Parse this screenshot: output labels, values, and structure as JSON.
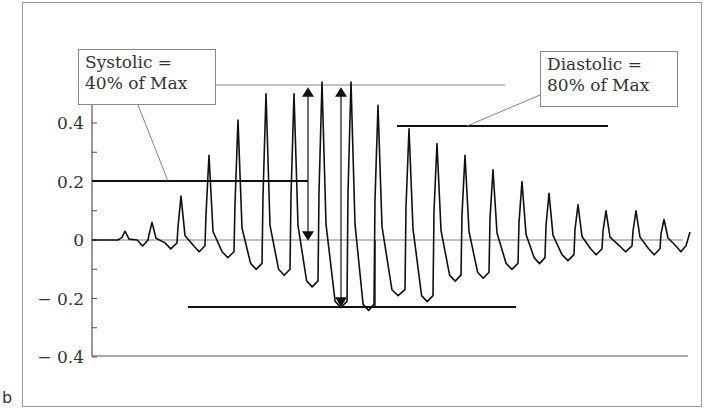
{
  "panel_label": "b",
  "callouts": {
    "systolic": {
      "line1": "Systolic =",
      "line2": "40% of Max"
    },
    "diastolic": {
      "line1": "Diastolic =",
      "line2": "80% of Max"
    }
  },
  "axis": {
    "y_ticks": [
      {
        "value": 0.4,
        "label": "0.4"
      },
      {
        "value": 0.2,
        "label": "0.2"
      },
      {
        "value": 0,
        "label": "0"
      },
      {
        "value": -0.2,
        "label": "− 0.2"
      },
      {
        "value": -0.4,
        "label": "− 0.4"
      }
    ]
  },
  "colors": {
    "trace": "#111111",
    "axis": "#555555",
    "frame": "#9a9a9a",
    "text": "#333333"
  },
  "chart_data": {
    "type": "line",
    "title": "",
    "xlabel": "",
    "ylabel": "",
    "ylim": [
      -0.4,
      0.4
    ],
    "grid": false,
    "legend": null,
    "series": [
      {
        "name": "oscillation amplitude",
        "peaks": [
          0.03,
          0.06,
          0.15,
          0.29,
          0.41,
          0.5,
          0.5,
          0.54,
          0.54,
          0.46,
          0.38,
          0.33,
          0.29,
          0.24,
          0.2,
          0.16,
          0.12,
          0.1,
          0.1,
          0.07
        ],
        "troughs": [
          0,
          -0.01,
          -0.02,
          -0.04,
          -0.08,
          -0.1,
          -0.14,
          -0.21,
          -0.22,
          -0.17,
          -0.19,
          -0.12,
          -0.11,
          -0.08,
          -0.06,
          -0.05,
          -0.03,
          -0.02,
          -0.03,
          -0.02
        ]
      }
    ],
    "reference_lines": [
      {
        "name": "max amplitude",
        "y": 0.54
      },
      {
        "name": "systolic threshold",
        "y": 0.2,
        "label": "Systolic = 40% of Max"
      },
      {
        "name": "diastolic threshold",
        "y": 0.39,
        "label": "Diastolic = 80% of Max"
      },
      {
        "name": "min baseline",
        "y": -0.23
      }
    ],
    "annotations": [
      "Systolic = 40% of Max",
      "Diastolic = 80% of Max"
    ],
    "tick_labels": [
      "0.4",
      "0.2",
      "0",
      "-0.2",
      "-0.4"
    ]
  }
}
